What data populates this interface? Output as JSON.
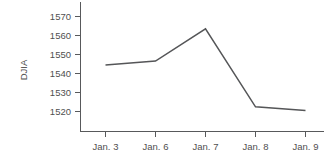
{
  "chart_data": {
    "type": "line",
    "title": "",
    "subtitle": "",
    "xlabel": "",
    "ylabel": "DJIA",
    "categories": [
      "Jan. 3",
      "Jan. 6",
      "Jan. 7",
      "Jan. 8",
      "Jan. 9"
    ],
    "values": [
      1544.5,
      1546.5,
      1563.5,
      1522.5,
      1520.5
    ],
    "series": [
      {
        "name": "DJIA",
        "values": [
          1544.5,
          1546.5,
          1563.5,
          1522.5,
          1520.5
        ]
      }
    ],
    "ylim": [
      1513,
      1574
    ],
    "yticks": [
      1520,
      1530,
      1540,
      1550,
      1560,
      1570
    ],
    "ytick_labels": [
      "1520",
      "1530",
      "1540",
      "1550",
      "1560",
      "1570"
    ],
    "xtick_labels": [
      "Jan. 3",
      "Jan. 6",
      "Jan. 7",
      "Jan. 8",
      "Jan. 9"
    ],
    "grid": false,
    "legend": false,
    "legend_position": "none",
    "line_color": "#555658",
    "axis_color": "#58595b",
    "text_color": "#4f4f4f",
    "background_color": "#ffffff"
  },
  "axes": {
    "y_axis_title": "DJIA",
    "y_tick_0": "1520",
    "y_tick_1": "1530",
    "y_tick_2": "1540",
    "y_tick_3": "1550",
    "y_tick_4": "1560",
    "y_tick_5": "1570",
    "x_tick_0": "Jan. 3",
    "x_tick_1": "Jan. 6",
    "x_tick_2": "Jan. 7",
    "x_tick_3": "Jan. 8",
    "x_tick_4": "Jan. 9"
  }
}
